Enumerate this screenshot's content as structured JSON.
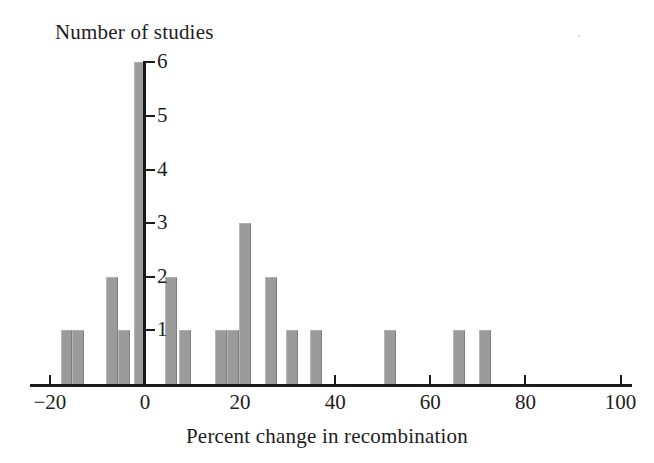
{
  "chart_data": {
    "type": "bar",
    "title": "",
    "xlabel": "Percent change in recombination",
    "ylabel": "Number of studies",
    "xlim": [
      -25,
      100
    ],
    "ylim": [
      0,
      6
    ],
    "grid": false,
    "legend": "none",
    "bin_width": 2.5,
    "xticks": [
      -20,
      0,
      20,
      40,
      60,
      80,
      100
    ],
    "xticklabels": [
      "−20",
      "0",
      "20",
      "40",
      "60",
      "80",
      "100"
    ],
    "yticks": [
      1,
      2,
      3,
      4,
      5,
      6
    ],
    "yticklabels": [
      "1",
      "2",
      "3",
      "4",
      "5",
      "6"
    ],
    "bar_color": "#9b9b9b",
    "axis_color": "#1a1a1a",
    "background_color": "#ffffff",
    "x": [
      -16.5,
      -14,
      -7,
      -4.5,
      -1,
      5.5,
      8.5,
      16,
      18.5,
      21,
      26.5,
      31,
      36,
      51.5,
      66,
      71.5
    ],
    "values": [
      1,
      1,
      2,
      1,
      6,
      2,
      1,
      1,
      1,
      3,
      2,
      1,
      1,
      1,
      1,
      1
    ],
    "categories": [
      "-16.5",
      "-14",
      "-7",
      "-4.5",
      "-1",
      "5.5",
      "8.5",
      "16",
      "18.5",
      "21",
      "26.5",
      "31",
      "36",
      "51.5",
      "66",
      "71.5"
    ],
    "total_studies": 19
  }
}
